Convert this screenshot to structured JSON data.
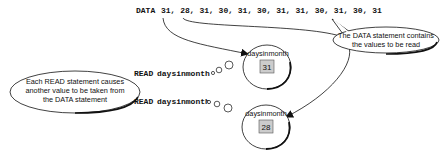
{
  "data_statement": {
    "keyword": "DATA",
    "values_text": "31, 28, 31, 30, 31, 30, 31, 31, 30, 31, 30, 31"
  },
  "callouts": {
    "data_note": [
      "The DATA statement contains",
      "the values to be read"
    ],
    "read_note": [
      "Each READ statement causes",
      "another value to be taken from",
      "the DATA statement"
    ]
  },
  "read_statements": [
    {
      "keyword": "READ",
      "variable": "daysinmonth"
    },
    {
      "keyword": "READ",
      "variable": "daysinmonth"
    }
  ],
  "variables": [
    {
      "name": "daysinmonth",
      "value": "31"
    },
    {
      "name": "daysinmonth",
      "value": "28"
    }
  ],
  "colors": {
    "value_box_fill": "#cccccc",
    "line": "#111111"
  }
}
